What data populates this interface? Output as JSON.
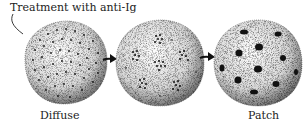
{
  "diagram": {
    "annotation": "Treatment with anti-Ig",
    "stages": [
      {
        "id": "diffuse",
        "label": "Diffuse",
        "pattern": "uniform-small-dots"
      },
      {
        "id": "clustered",
        "label": "",
        "pattern": "small-dot-clusters"
      },
      {
        "id": "patch",
        "label": "Patch",
        "pattern": "large-dark-patches"
      }
    ],
    "arrows": [
      {
        "from": "diffuse",
        "to": "clustered",
        "icon": "right-arrow-icon"
      },
      {
        "from": "clustered",
        "to": "patch",
        "icon": "right-arrow-icon"
      }
    ],
    "colors": {
      "ink": "#1a1a1a",
      "cell_fill": "#f4f4f4",
      "background": "#ffffff"
    }
  }
}
